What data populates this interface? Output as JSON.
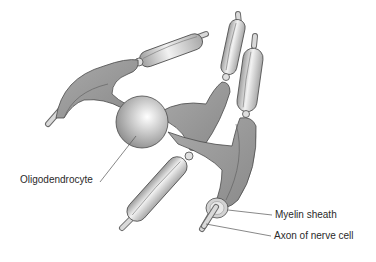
{
  "figure": {
    "type": "anatomical-illustration",
    "colors": {
      "background": "#ffffff",
      "process_fill": "#9a9a9a",
      "sheath_light": "#e6e6e6",
      "sheath_mid": "#b8b8b8",
      "outline": "#4a4a4a",
      "leader_line": "#555555",
      "text": "#2a2a2a"
    }
  },
  "labels": {
    "oligodendrocyte": "Oligodendrocyte",
    "myelin_sheath": "Myelin sheath",
    "axon": "Axon of nerve cell"
  }
}
